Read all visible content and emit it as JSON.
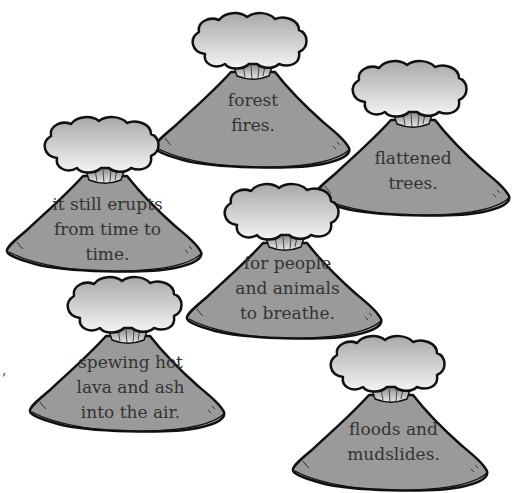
{
  "colors": {
    "body_fill": "#9a9a9a",
    "cloud_top": "#a8a8a8",
    "cloud_bottom": "#f2f2f2",
    "outline": "#111111",
    "text": "#333333"
  },
  "volcanoes": [
    {
      "id": "forest-fires",
      "lines": [
        "forest",
        "fires."
      ]
    },
    {
      "id": "flattened-trees",
      "lines": [
        "flattened",
        "trees."
      ]
    },
    {
      "id": "still-erupts",
      "lines": [
        "it still erupts",
        "from time to",
        "time."
      ]
    },
    {
      "id": "people-animals-breathe",
      "lines": [
        "for people",
        "and animals",
        "to breathe."
      ]
    },
    {
      "id": "spewing-lava-ash",
      "lines": [
        "spewing hot",
        "lava and ash",
        "into the air."
      ]
    },
    {
      "id": "floods-mudslides",
      "lines": [
        "floods and",
        "mudslides."
      ]
    }
  ],
  "stray_mark": ","
}
